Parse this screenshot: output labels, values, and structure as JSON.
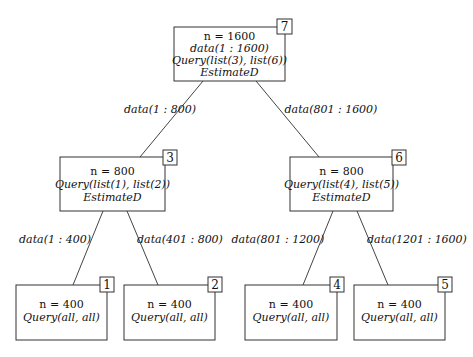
{
  "nodes": {
    "n7": {
      "id": "7",
      "lines": [
        "n = 1600",
        "data(1 : 1600)",
        "Query(list(3), list(6))",
        "EstimateD"
      ]
    },
    "n3": {
      "id": "3",
      "lines": [
        "n = 800",
        "Query(list(1), list(2))",
        "EstimateD"
      ]
    },
    "n6": {
      "id": "6",
      "lines": [
        "n = 800",
        "Query(list(4), list(5))",
        "EstimateD"
      ]
    },
    "n1": {
      "id": "1",
      "lines": [
        "n = 400",
        "Query(all, all)"
      ]
    },
    "n2": {
      "id": "2",
      "lines": [
        "n = 400",
        "Query(all, all)"
      ]
    },
    "n4": {
      "id": "4",
      "lines": [
        "n = 400",
        "Query(all, all)"
      ]
    },
    "n5": {
      "id": "5",
      "lines": [
        "n = 400",
        "Query(all, all)"
      ]
    }
  },
  "edges": {
    "e7_3": "data(1 : 800)",
    "e7_6": "data(801 : 1600)",
    "e3_1": "data(1 : 400)",
    "e3_2": "data(401 : 800)",
    "e6_4": "data(801 : 1200)",
    "e6_5": "data(1201 : 1600)"
  }
}
